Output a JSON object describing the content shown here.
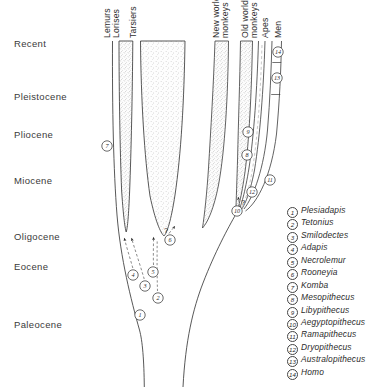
{
  "epochs": [
    {
      "label": "Recent",
      "y": 38
    },
    {
      "label": "Pleistocene",
      "y": 91
    },
    {
      "label": "Pliocene",
      "y": 129
    },
    {
      "label": "Miocene",
      "y": 175
    },
    {
      "label": "Oligocene",
      "y": 231
    },
    {
      "label": "Eocene",
      "y": 261
    },
    {
      "label": "Paleocene",
      "y": 319
    }
  ],
  "lineages": [
    {
      "name": "Lemurs\nLorises",
      "label_x": 103,
      "label_y": 38,
      "lines": [
        "Lemurs",
        "Lorises"
      ]
    },
    {
      "name": "Tarsiers",
      "label_x": 129,
      "label_y": 38,
      "lines": [
        "Tarsiers"
      ]
    },
    {
      "name": "New world monkeys",
      "label_x": 212,
      "label_y": 38,
      "lines": [
        "New world",
        "monkeys"
      ]
    },
    {
      "name": "Old world monkeys",
      "label_x": 241,
      "label_y": 38,
      "lines": [
        "Old world",
        "monkeys"
      ]
    },
    {
      "name": "Apes",
      "label_x": 261,
      "label_y": 38,
      "lines": [
        "Apes"
      ]
    },
    {
      "name": "Men",
      "label_x": 274,
      "label_y": 38,
      "lines": [
        "Men"
      ]
    }
  ],
  "legend": [
    {
      "n": "1",
      "name": "Plesiadapis"
    },
    {
      "n": "2",
      "name": "Tetonius"
    },
    {
      "n": "3",
      "name": "Smilodectes"
    },
    {
      "n": "4",
      "name": "Adapis"
    },
    {
      "n": "5",
      "name": "Necrolemur"
    },
    {
      "n": "6",
      "name": "Rooneyia"
    },
    {
      "n": "7",
      "name": "Komba"
    },
    {
      "n": "8",
      "name": "Mesopithecus"
    },
    {
      "n": "9",
      "name": "Libypithecus"
    },
    {
      "n": "10",
      "name": "Aegyptopithecus"
    },
    {
      "n": "11",
      "name": "Ramapithecus"
    },
    {
      "n": "12",
      "name": "Dryopithecus"
    },
    {
      "n": "13",
      "name": "Australopithecus"
    },
    {
      "n": "14",
      "name": "Homo"
    }
  ],
  "markers": [
    {
      "n": "7",
      "x": 107,
      "y": 146
    },
    {
      "n": "4",
      "x": 133,
      "y": 275
    },
    {
      "n": "3",
      "x": 145,
      "y": 286
    },
    {
      "n": "2",
      "x": 158,
      "y": 298
    },
    {
      "n": "5",
      "x": 153,
      "y": 272
    },
    {
      "n": "6",
      "x": 170,
      "y": 240
    },
    {
      "n": "1",
      "x": 140,
      "y": 315
    },
    {
      "n": "8",
      "x": 247,
      "y": 155
    },
    {
      "n": "9",
      "x": 248,
      "y": 132
    },
    {
      "n": "10",
      "x": 237,
      "y": 211
    },
    {
      "n": "11",
      "x": 270,
      "y": 180
    },
    {
      "n": "12",
      "x": 252,
      "y": 192
    },
    {
      "n": "13",
      "x": 277,
      "y": 78
    },
    {
      "n": "14",
      "x": 278,
      "y": 52
    }
  ],
  "query_marks": [
    {
      "label": "?",
      "x": 164,
      "y": 233
    },
    {
      "label": "?",
      "x": 241,
      "y": 205
    }
  ],
  "colors": {
    "ink": "#2b2b2b",
    "stipple": "#8d8d8d",
    "background": "#ffffff"
  }
}
